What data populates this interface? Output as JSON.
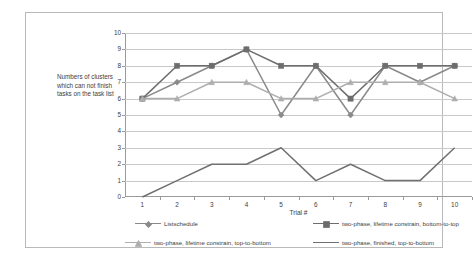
{
  "chart_data": {
    "type": "line",
    "title": "",
    "xlabel": "Trial #",
    "ylabel": "Numbers of clusters which can not finish tasks on the task list",
    "x": [
      1,
      2,
      3,
      4,
      5,
      6,
      7,
      8,
      9,
      10
    ],
    "xtick_labels": [
      "1",
      "2",
      "3",
      "4",
      "5",
      "6",
      "7",
      "8",
      "9",
      "10"
    ],
    "ytick_labels": [
      "0",
      "1",
      "2",
      "3",
      "4",
      "5",
      "6",
      "7",
      "8",
      "9",
      "10"
    ],
    "ylim": [
      0,
      10
    ],
    "grid": true,
    "legend_position": "bottom",
    "series": [
      {
        "name": "Listschedule",
        "marker": "diamond",
        "color": "#8a8a8a",
        "values": [
          6,
          7,
          8,
          9,
          5,
          8,
          5,
          8,
          7,
          8
        ]
      },
      {
        "name": "two-phase, lifetime constrain, bottom-to-top",
        "marker": "square",
        "color": "#6d6d6d",
        "values": [
          6,
          8,
          8,
          9,
          8,
          8,
          6,
          8,
          8,
          8
        ]
      },
      {
        "name": "two-phase, lifetime constrain, top-to-bottom",
        "marker": "triangle",
        "color": "#aeaeae",
        "values": [
          6,
          6,
          7,
          7,
          6,
          6,
          7,
          7,
          7,
          6
        ]
      },
      {
        "name": "two-phase, finished, top-to-bottom",
        "marker": "none",
        "color": "#707070",
        "values": [
          0,
          1,
          2,
          2,
          3,
          1,
          2,
          1,
          1,
          3
        ]
      }
    ]
  },
  "legend": {
    "items": [
      {
        "label": "Listschedule"
      },
      {
        "label": "two-phase, lifetime constrain, bottom-to-top"
      },
      {
        "label": "two-phase, lifetime constrain, top-to-bottom"
      },
      {
        "label": "two-phase, finished, top-to-bottom"
      }
    ]
  },
  "colors": {
    "grid": "#c8c8c8",
    "axis": "#9a9a9a",
    "border": "#b9b9b9",
    "text": "#3d3d3d",
    "background": "#ffffff"
  }
}
